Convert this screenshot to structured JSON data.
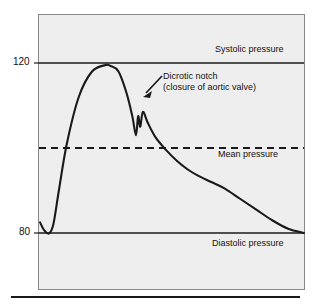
{
  "figure": {
    "name": "arterial-blood-pressure-waveform",
    "background_color": "#eeeeee",
    "frame_color": "#888888",
    "curve_color": "#1a1a1a"
  },
  "axis": {
    "tick_systolic": "120",
    "tick_diastolic": "80"
  },
  "annotations": {
    "systolic": "Systolic pressure",
    "mean": "Mean pressure",
    "diastolic": "Diastolic pressure",
    "notch_line1": "Dicrotic notch",
    "notch_line2": "(closure of aortic valve)"
  },
  "chart_data": {
    "type": "line",
    "title": "",
    "xlabel": "",
    "ylabel": "",
    "grid": false,
    "legend": "none",
    "ylim": [
      70,
      130
    ],
    "xlim": [
      0,
      1
    ],
    "yticks": [
      80,
      120
    ],
    "ytick_labels": [
      "80",
      "120"
    ],
    "reference_lines": [
      {
        "name": "systolic-line",
        "value": 120,
        "style": "solid",
        "label": "Systolic pressure"
      },
      {
        "name": "mean-line",
        "value": 100,
        "style": "dashed",
        "label": "Mean pressure"
      },
      {
        "name": "diastolic-line",
        "value": 80,
        "style": "solid",
        "label": "Diastolic pressure"
      }
    ],
    "annotation_points": [
      {
        "name": "dicrotic-notch",
        "x": 0.37,
        "y": 106,
        "label": "Dicrotic notch (closure of aortic valve)"
      }
    ],
    "series": [
      {
        "name": "arterial pressure",
        "x": [
          0.004,
          0.02,
          0.038,
          0.054,
          0.075,
          0.105,
          0.15,
          0.2,
          0.25,
          0.27,
          0.3,
          0.33,
          0.352,
          0.366,
          0.374,
          0.382,
          0.392,
          0.41,
          0.44,
          0.48,
          0.52,
          0.56,
          0.6,
          0.65,
          0.7,
          0.76,
          0.82,
          0.88,
          0.94,
          1.0
        ],
        "y": [
          82.5,
          80.6,
          79.9,
          82.0,
          90.0,
          101.0,
          112.0,
          118.0,
          119.5,
          119.3,
          118.0,
          113.0,
          107.5,
          103.0,
          107.5,
          105.0,
          108.5,
          106.0,
          102.5,
          99.5,
          97.0,
          95.0,
          93.5,
          92.0,
          90.5,
          88.0,
          85.5,
          83.0,
          81.0,
          80.0
        ]
      }
    ]
  }
}
